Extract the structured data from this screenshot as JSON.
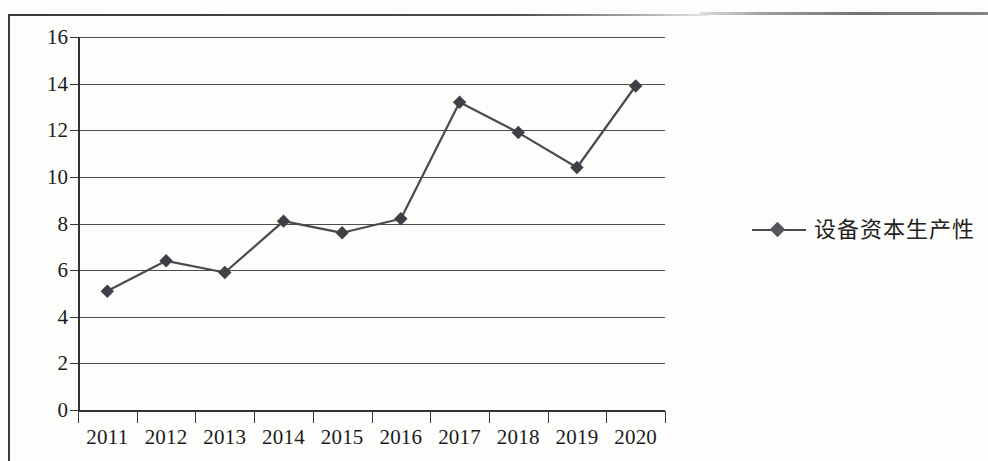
{
  "chart_data": {
    "type": "line",
    "title": "",
    "subtitle": "",
    "xlabel": "",
    "ylabel": "",
    "categories": [
      "2011",
      "2012",
      "2013",
      "2014",
      "2015",
      "2016",
      "2017",
      "2018",
      "2019",
      "2020"
    ],
    "series": [
      {
        "name": "设备资本生产性",
        "values": [
          5.1,
          6.4,
          5.9,
          8.1,
          7.6,
          8.2,
          13.2,
          11.9,
          10.4,
          13.9
        ],
        "marker": "diamond",
        "color": "#4a4a50"
      }
    ],
    "ylim": [
      0,
      16
    ],
    "ytick_values": [
      0,
      2,
      4,
      6,
      8,
      10,
      12,
      14,
      16
    ],
    "ytick_labels": [
      "0",
      "2",
      "4",
      "6",
      "8",
      "10",
      "12",
      "14",
      "16"
    ],
    "grid": true,
    "grid_axis": "y",
    "legend_position": "right",
    "legend_entries": [
      "设备资本生产性"
    ]
  },
  "legend": {
    "label": "设备资本生产性"
  },
  "colors": {
    "line": "#4a4a50",
    "marker": "#3f3f46",
    "grid": "#4d4d4d",
    "axis": "#333333",
    "text": "#1b1b1b",
    "background": "#fdfdfc"
  }
}
